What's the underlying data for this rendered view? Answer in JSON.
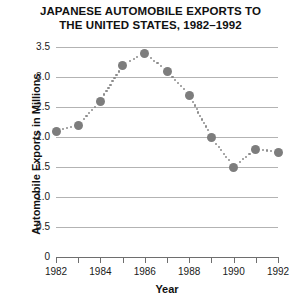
{
  "chart_data": {
    "type": "line",
    "title": "JAPANESE AUTOMOBILE EXPORTS TO THE UNITED STATES, 1982–1992",
    "title_line1": "JAPANESE AUTOMOBILE EXPORTS TO",
    "title_line2": "THE UNITED STATES, 1982–1992",
    "xlabel": "Year",
    "ylabel": "Automobile Exports in Millions",
    "x": [
      1982,
      1983,
      1984,
      1985,
      1986,
      1987,
      1988,
      1989,
      1990,
      1991,
      1992
    ],
    "values": [
      2.1,
      2.2,
      2.6,
      3.2,
      3.4,
      3.1,
      2.7,
      2.0,
      1.5,
      1.8,
      1.75
    ],
    "series": [
      {
        "name": "Automobile Exports in Millions",
        "values": [
          2.1,
          2.2,
          2.6,
          3.2,
          3.4,
          3.1,
          2.7,
          2.0,
          1.5,
          1.8,
          1.75
        ]
      }
    ],
    "xlim": [
      1982,
      1992
    ],
    "ylim": [
      0,
      3.5
    ],
    "ytick_labels": [
      "3.5",
      "3.0",
      "2.5",
      "2.0",
      "1.5",
      "1.0",
      "0.5",
      "0"
    ],
    "ytick_values": [
      3.5,
      3.0,
      2.5,
      2.0,
      1.5,
      1.0,
      0.5,
      0
    ],
    "xtick_values": [
      1982,
      1983,
      1984,
      1985,
      1986,
      1987,
      1988,
      1989,
      1990,
      1991,
      1992
    ],
    "xtick_labels": [
      "1982",
      "",
      "1984",
      "",
      "1986",
      "",
      "1988",
      "",
      "1990",
      "",
      "1992"
    ],
    "grid": true,
    "legend": "none",
    "marker_style": "circle",
    "line_style": "dotted",
    "colors": {
      "marker": "#7d7d7d",
      "line": "#8c8c8c",
      "gridline": "#b3b3b3",
      "axis": "#6e6e6e",
      "text": "#111111",
      "background": "#ffffff"
    }
  }
}
